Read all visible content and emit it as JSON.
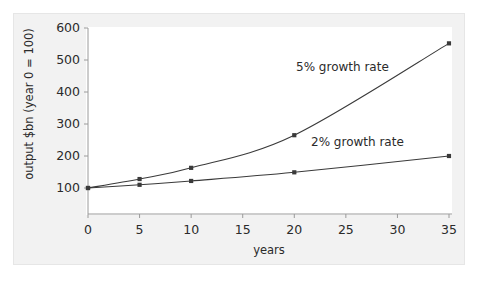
{
  "figure": {
    "background_color": "#f2f2f2",
    "panel_color": "#ffffff",
    "axis_color": "#9a9a9a",
    "line_color": "#3a3a3a",
    "text_color": "#2b2b2b"
  },
  "chart_data": {
    "type": "line",
    "title": "",
    "subtitle": "",
    "xlabel": "years",
    "ylabel": "output $bn (year 0 = 100)",
    "xlim": [
      0,
      35
    ],
    "ylim": [
      0,
      600
    ],
    "xticks": [
      0,
      5,
      10,
      15,
      20,
      25,
      30,
      35
    ],
    "xtick_labels": [
      "0",
      "5",
      "10",
      "15",
      "20",
      "25",
      "30",
      "35"
    ],
    "yticks": [
      100,
      200,
      300,
      400,
      500,
      600
    ],
    "ytick_labels": [
      "100",
      "200",
      "300",
      "400",
      "500",
      "600"
    ],
    "grid": false,
    "legend": "annotations-inline",
    "x": [
      0,
      5,
      10,
      20,
      35
    ],
    "series": [
      {
        "name": "5% growth rate",
        "label": "5% growth rate",
        "values": [
          100,
          128,
          163,
          265,
          552
        ],
        "marker": "square",
        "color": "#3a3a3a"
      },
      {
        "name": "2% growth rate",
        "label": "2% growth rate",
        "values": [
          100,
          110,
          122,
          149,
          200
        ],
        "marker": "square",
        "color": "#3a3a3a"
      }
    ],
    "annotations": [
      {
        "text": "5% growth rate",
        "series": "5% growth rate"
      },
      {
        "text": "2% growth rate",
        "series": "2% growth rate"
      }
    ]
  }
}
